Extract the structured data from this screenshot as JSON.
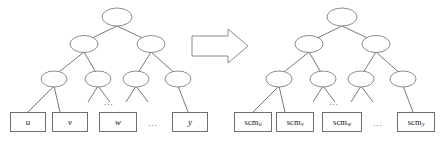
{
  "figure": {
    "background_color": "#ffffff",
    "node_stroke_color": "#6e6e6e",
    "edge_stroke_color": "#555555",
    "arrow_fill_color": "#ffffff",
    "arrow_stroke_color": "#8a8a8a",
    "text_color": "#1a1a1a"
  },
  "left_tree": {
    "name": "source-parse-tree",
    "ellipsis_between_leaves": "...",
    "ellipsis_between_subtrees": "...",
    "leaves": [
      {
        "id": "leaf-u",
        "label": "u"
      },
      {
        "id": "leaf-v",
        "label": "v"
      },
      {
        "id": "leaf-w",
        "label": "w"
      },
      {
        "id": "leaf-y",
        "label": "y"
      }
    ]
  },
  "arrow": {
    "name": "transformation-arrow",
    "direction": "right",
    "label": ""
  },
  "right_tree": {
    "name": "target-parse-tree",
    "ellipsis_between_leaves": "...",
    "ellipsis_between_subtrees": "...",
    "leaves": [
      {
        "id": "leaf-scm-u",
        "base": "scm",
        "subscript": "u"
      },
      {
        "id": "leaf-scm-v",
        "base": "scm",
        "subscript": "v"
      },
      {
        "id": "leaf-scm-w",
        "base": "scm",
        "subscript": "w"
      },
      {
        "id": "leaf-scm-y",
        "base": "scm",
        "subscript": "y"
      }
    ]
  }
}
